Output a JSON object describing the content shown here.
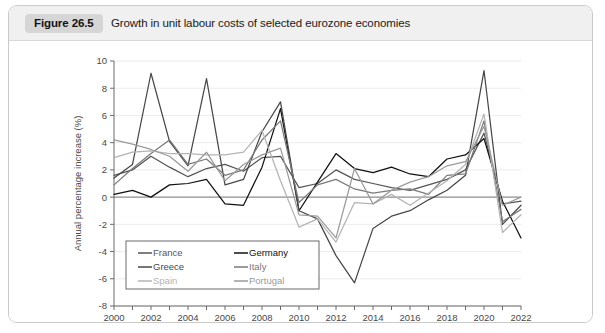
{
  "figure": {
    "badge": "Figure 26.5",
    "title": "Growth in unit labour costs of selected eurozone economies"
  },
  "chart_data": {
    "type": "line",
    "title": "Growth in unit labour costs of selected eurozone economies",
    "xlabel": "",
    "ylabel": "Annual percentage increase (%)",
    "xlim": [
      2000,
      2022
    ],
    "ylim": [
      -8,
      10
    ],
    "ytick_step": 2,
    "xtick_step": 2,
    "grid": true,
    "legend_position": "bottom-left",
    "x": [
      2000,
      2001,
      2002,
      2003,
      2004,
      2005,
      2006,
      2007,
      2008,
      2009,
      2010,
      2011,
      2012,
      2013,
      2014,
      2015,
      2016,
      2017,
      2018,
      2019,
      2020,
      2021,
      2022
    ],
    "yticks": [
      -8,
      -6,
      -4,
      -2,
      0,
      2,
      4,
      6,
      8,
      10
    ],
    "xticks": [
      2000,
      2002,
      2004,
      2006,
      2008,
      2010,
      2012,
      2014,
      2016,
      2018,
      2020,
      2022
    ],
    "series": [
      {
        "name": "France",
        "color": "#555555",
        "values": [
          1.6,
          2.0,
          3.0,
          2.2,
          1.5,
          2.1,
          2.4,
          1.9,
          2.9,
          3.0,
          0.7,
          1.0,
          2.0,
          1.3,
          1.0,
          0.7,
          0.5,
          0.9,
          1.3,
          2.0,
          4.7,
          -0.5,
          -0.3
        ]
      },
      {
        "name": "Germany",
        "color": "#111111",
        "values": [
          0.2,
          0.5,
          0.0,
          0.9,
          1.0,
          1.3,
          -0.5,
          -0.6,
          2.2,
          6.5,
          -1.0,
          1.1,
          3.2,
          2.1,
          1.8,
          2.2,
          1.7,
          1.5,
          2.8,
          3.1,
          4.3,
          -0.3,
          -3.0
        ]
      },
      {
        "name": "Greece",
        "color": "#484848",
        "values": [
          1.4,
          2.4,
          9.1,
          4.1,
          2.3,
          8.7,
          0.9,
          1.3,
          4.8,
          7.0,
          -1.0,
          -1.6,
          -4.3,
          -6.3,
          -2.3,
          -1.4,
          -1.0,
          -0.2,
          0.5,
          1.6,
          9.3,
          -2.0,
          -0.6
        ]
      },
      {
        "name": "Italy",
        "color": "#7a7a7a",
        "values": [
          0.9,
          2.1,
          3.2,
          4.2,
          2.4,
          2.8,
          1.6,
          2.0,
          4.2,
          5.6,
          -0.4,
          0.9,
          1.3,
          0.6,
          0.3,
          0.5,
          0.6,
          0.2,
          1.6,
          1.7,
          5.6,
          -1.8,
          -0.9
        ]
      },
      {
        "name": "Spain",
        "color": "#b4b4b4",
        "values": [
          2.9,
          3.3,
          3.4,
          3.2,
          3.2,
          3.1,
          3.1,
          3.3,
          4.9,
          1.2,
          -2.2,
          -1.6,
          -3.3,
          -0.4,
          -0.5,
          0.2,
          -0.6,
          0.3,
          1.2,
          2.4,
          6.1,
          -2.6,
          -1.3
        ]
      },
      {
        "name": "Portugal",
        "color": "#9a9a9a",
        "values": [
          4.2,
          3.9,
          3.5,
          3.0,
          1.9,
          3.3,
          1.2,
          2.4,
          3.1,
          3.6,
          -1.3,
          -1.4,
          -3.0,
          2.1,
          -0.5,
          0.5,
          1.1,
          1.5,
          2.3,
          2.6,
          5.2,
          -0.6,
          0.0
        ]
      }
    ]
  },
  "legend": {
    "entries": [
      {
        "label": "France",
        "color": "#555555"
      },
      {
        "label": "Germany",
        "color": "#111111"
      },
      {
        "label": "Greece",
        "color": "#484848"
      },
      {
        "label": "Italy",
        "color": "#7a7a7a"
      },
      {
        "label": "Spain",
        "color": "#b4b4b4"
      },
      {
        "label": "Portugal",
        "color": "#9a9a9a"
      }
    ]
  }
}
